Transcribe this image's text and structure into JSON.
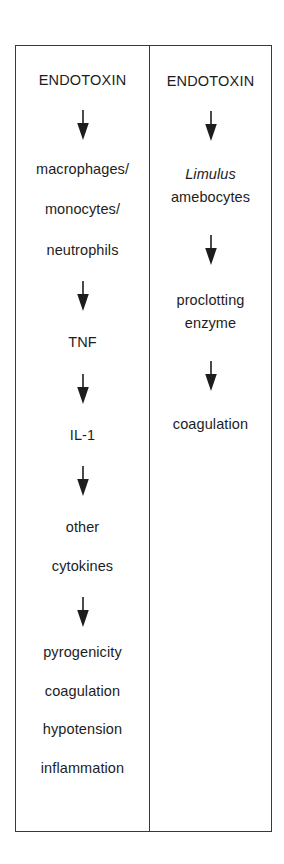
{
  "figure": {
    "background_color": "#ffffff",
    "border_color": "#3a3a3a",
    "text_color": "#1d1d1d",
    "panels": [
      {
        "id": "mammalian-pathway",
        "side": "left",
        "nodes": [
          {
            "id": "endotoxin",
            "lines": [
              "ENDOTOXIN"
            ],
            "style": "caps"
          },
          {
            "id": "cells",
            "lines": [
              "macrophages/",
              "monocytes/",
              "neutrophils"
            ],
            "style": "normal"
          },
          {
            "id": "tnf",
            "lines": [
              "TNF"
            ],
            "style": "normal"
          },
          {
            "id": "il-1",
            "lines": [
              "IL-1"
            ],
            "style": "normal"
          },
          {
            "id": "other-cytokines",
            "lines": [
              "other",
              "cytokines"
            ],
            "style": "normal"
          },
          {
            "id": "effects",
            "lines": [
              "pyrogenicity",
              "coagulation",
              "hypotension",
              "inflammation"
            ],
            "style": "normal"
          }
        ],
        "arrow_count": 5
      },
      {
        "id": "limulus-pathway",
        "side": "right",
        "nodes": [
          {
            "id": "endotoxin",
            "lines": [
              "ENDOTOXIN"
            ],
            "style": "caps"
          },
          {
            "id": "limulus-amebocytes",
            "lines": [
              "Limulus",
              "amebocytes"
            ],
            "style": "italic-first"
          },
          {
            "id": "proclotting-enzyme",
            "lines": [
              "proclotting",
              "enzyme"
            ],
            "style": "normal"
          },
          {
            "id": "coagulation",
            "lines": [
              "coagulation"
            ],
            "style": "normal"
          }
        ],
        "arrow_count": 3
      }
    ]
  },
  "left": {
    "endotoxin": "ENDOTOXIN",
    "cells_1": "macrophages/",
    "cells_2": "monocytes/",
    "cells_3": "neutrophils",
    "tnf": "TNF",
    "il1": "IL-1",
    "cytokines_1": "other",
    "cytokines_2": "cytokines",
    "effects_1": "pyrogenicity",
    "effects_2": "coagulation",
    "effects_3": "hypotension",
    "effects_4": "inflammation"
  },
  "right": {
    "endotoxin": "ENDOTOXIN",
    "limulus": "Limulus",
    "amebocytes": "amebocytes",
    "proclotting_1": "proclotting",
    "proclotting_2": "enzyme",
    "coagulation": "coagulation"
  }
}
